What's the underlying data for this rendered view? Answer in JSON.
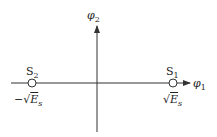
{
  "diagram": {
    "axes": {
      "x_label": "φ",
      "x_sub": "1",
      "y_label": "φ",
      "y_sub": "2"
    },
    "points": [
      {
        "name": "S",
        "sub": "1",
        "value_prefix": "√",
        "value_main": "E",
        "value_sub": "s"
      },
      {
        "name": "S",
        "sub": "2",
        "value_prefix": "−√",
        "value_main": "E",
        "value_sub": "s"
      }
    ],
    "colors": {
      "line": "#333333",
      "background": "#ffffff"
    }
  }
}
